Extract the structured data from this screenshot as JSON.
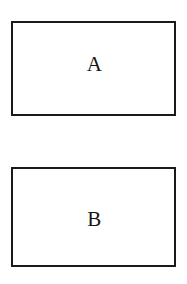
{
  "diagram": {
    "type": "labeled-rectangles",
    "background_color": "#ffffff",
    "stroke_color": "#1a1a1a",
    "text_color": "#161616",
    "boxes": [
      {
        "id": "box-a",
        "label": "A",
        "position": "top"
      },
      {
        "id": "box-b",
        "label": "B",
        "position": "bottom"
      }
    ]
  }
}
